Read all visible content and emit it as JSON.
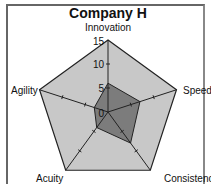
{
  "chart_data": {
    "type": "radar",
    "title": "Company H",
    "axes": [
      "Innovation",
      "Speed",
      "Consistency",
      "Acuity",
      "Agility"
    ],
    "series": [
      {
        "name": "Company H",
        "values": [
          6,
          7,
          8,
          4,
          3
        ]
      }
    ],
    "rlim": [
      0,
      15
    ],
    "r_ticks": [
      "0",
      "5",
      "10",
      "15"
    ],
    "colors": {
      "background_polygon": "#c8c8c8",
      "data_polygon": "#6e6e6e",
      "axis_line": "#222222"
    }
  }
}
